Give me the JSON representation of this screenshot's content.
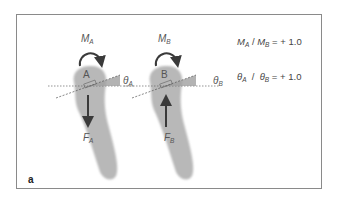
{
  "figure": {
    "panel_label": "a",
    "tooth_a": {
      "point_label": "A",
      "moment": {
        "symbol": "M",
        "sub": "A",
        "direction": "clockwise"
      },
      "force": {
        "symbol": "F",
        "sub": "A",
        "direction": "down"
      },
      "angle": {
        "symbol": "θ",
        "sub": "A"
      }
    },
    "tooth_b": {
      "point_label": "B",
      "moment": {
        "symbol": "M",
        "sub": "B",
        "direction": "clockwise"
      },
      "force": {
        "symbol": "F",
        "sub": "B",
        "direction": "up"
      },
      "angle": {
        "symbol": "θ",
        "sub": "B"
      }
    },
    "equations": [
      {
        "lhs_num": "M",
        "lhs_num_sub": "A",
        "sep": " / ",
        "lhs_den": "M",
        "lhs_den_sub": "B",
        "rhs": " = + 1.0"
      },
      {
        "lhs_num": "θ",
        "lhs_num_sub": "A",
        "sep": "  /  ",
        "lhs_den": "θ",
        "lhs_den_sub": "B",
        "rhs": " = + 1.0"
      }
    ],
    "colors": {
      "tooth_fill": "#b8b8b8",
      "arrow": "#3a3a3a",
      "wedge": "#a0a0a0",
      "frame": "#8a8a8a"
    }
  }
}
